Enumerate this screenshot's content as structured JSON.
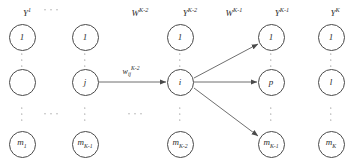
{
  "diagram": {
    "stroke_color": "#4a4a4a",
    "text_color": "#2b2b2b",
    "background": "#ffffff"
  },
  "layer_labels": [
    {
      "name": "layer-label-1",
      "text": "Y",
      "sup": "1",
      "x": 27,
      "y": 7
    },
    {
      "name": "layer-label-wk2",
      "text": "W",
      "sup": "K-2",
      "x": 140,
      "y": 7
    },
    {
      "name": "layer-label-yk2",
      "text": "Y",
      "sup": "K-2",
      "x": 190,
      "y": 7
    },
    {
      "name": "layer-label-wk1",
      "text": "W",
      "sup": "K-1",
      "x": 234,
      "y": 7
    },
    {
      "name": "layer-label-yk1",
      "text": "Y",
      "sup": "K-1",
      "x": 282,
      "y": 7
    },
    {
      "name": "layer-label-yk",
      "text": "Y",
      "sup": "K",
      "x": 335,
      "y": 7
    }
  ],
  "weight_label": {
    "name": "weight-label-w-ij",
    "base": "w",
    "sub": "ij",
    "sup": "K-2",
    "x": 131,
    "y": 66
  },
  "columns": [
    {
      "name": "layer-column-1",
      "x": 22,
      "nodes": [
        {
          "name": "node-1-top",
          "label": "1",
          "sub": "",
          "y": 37
        },
        {
          "name": "node-1-middle",
          "label": "",
          "sub": "",
          "y": 82
        },
        {
          "name": "node-1-bottom",
          "label": "m",
          "sub": "1",
          "y": 144
        }
      ]
    },
    {
      "name": "layer-column-2",
      "x": 85,
      "nodes": [
        {
          "name": "node-2-top",
          "label": "1",
          "sub": "",
          "y": 37
        },
        {
          "name": "node-2-middle",
          "label": "j",
          "sub": "",
          "y": 82
        },
        {
          "name": "node-2-bottom",
          "label": "m",
          "sub": "K-1",
          "y": 144
        }
      ]
    },
    {
      "name": "layer-column-3",
      "x": 180,
      "nodes": [
        {
          "name": "node-3-top",
          "label": "1",
          "sub": "",
          "y": 37
        },
        {
          "name": "node-3-middle",
          "label": "i",
          "sub": "",
          "y": 82
        },
        {
          "name": "node-3-bottom",
          "label": "m",
          "sub": "K-2",
          "y": 144
        }
      ]
    },
    {
      "name": "layer-column-4",
      "x": 271,
      "nodes": [
        {
          "name": "node-4-top",
          "label": "1",
          "sub": "",
          "y": 37
        },
        {
          "name": "node-4-middle",
          "label": "p",
          "sub": "",
          "y": 82
        },
        {
          "name": "node-4-bottom",
          "label": "m",
          "sub": "K-1",
          "y": 144
        }
      ]
    },
    {
      "name": "layer-column-5",
      "x": 331,
      "nodes": [
        {
          "name": "node-5-top",
          "label": "1",
          "sub": "",
          "y": 37
        },
        {
          "name": "node-5-middle",
          "label": "l",
          "sub": "",
          "y": 82
        },
        {
          "name": "node-5-bottom",
          "label": "m",
          "sub": "K",
          "y": 144
        }
      ]
    }
  ],
  "vertical_ellipses": [
    {
      "name": "vdots-col1-upper",
      "x": 22,
      "y": 60
    },
    {
      "name": "vdots-col1-lower",
      "x": 22,
      "y": 114
    },
    {
      "name": "vdots-col2-upper",
      "x": 85,
      "y": 60
    },
    {
      "name": "vdots-col2-lower",
      "x": 85,
      "y": 114
    },
    {
      "name": "vdots-col3-upper",
      "x": 180,
      "y": 60
    },
    {
      "name": "vdots-col3-lower",
      "x": 180,
      "y": 114
    },
    {
      "name": "vdots-col4-upper",
      "x": 271,
      "y": 60
    },
    {
      "name": "vdots-col4-lower",
      "x": 271,
      "y": 114
    },
    {
      "name": "vdots-col5-upper",
      "x": 331,
      "y": 60
    },
    {
      "name": "vdots-col5-lower",
      "x": 331,
      "y": 114
    }
  ],
  "horizontal_ellipses": [
    {
      "name": "hdots-top-between-col1-col2",
      "x": 51,
      "y": 10
    },
    {
      "name": "hdots-bottom-between-col1-col2",
      "x": 51,
      "y": 114
    },
    {
      "name": "hdots-bottom-between-col2-col3",
      "x": 135,
      "y": 114
    }
  ],
  "edges": [
    {
      "name": "edge-j-to-i",
      "x1": 99,
      "y1": 82,
      "x2": 166,
      "y2": 82
    },
    {
      "name": "edge-i-to-top",
      "x1": 194,
      "y1": 78,
      "x2": 258,
      "y2": 44
    },
    {
      "name": "edge-i-to-p",
      "x1": 194,
      "y1": 82,
      "x2": 257,
      "y2": 82
    },
    {
      "name": "edge-i-to-bottom",
      "x1": 194,
      "y1": 88,
      "x2": 258,
      "y2": 136
    }
  ]
}
